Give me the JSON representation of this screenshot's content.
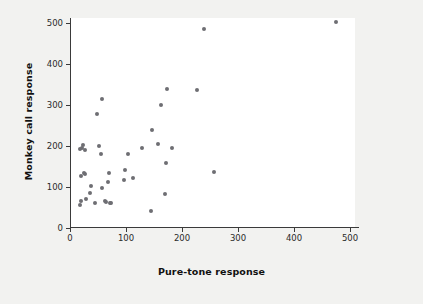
{
  "chart_data": {
    "type": "scatter",
    "title": "",
    "xlabel": "Pure-tone response",
    "ylabel": "Monkey call response",
    "xlim": [
      0,
      550
    ],
    "ylim": [
      0,
      520
    ],
    "xticks": [
      0,
      100,
      200,
      300,
      400,
      500
    ],
    "yticks": [
      0,
      100,
      200,
      300,
      400,
      500
    ],
    "grid": false,
    "legend": null,
    "marker_color": "#6e6e73",
    "background_color": "#f2f2f0",
    "plot_background_color": "#ffffff",
    "axis_color": "#3a3a3a",
    "points": [
      {
        "x": 17,
        "y": 193
      },
      {
        "x": 22,
        "y": 196
      },
      {
        "x": 24,
        "y": 203
      },
      {
        "x": 26,
        "y": 191
      },
      {
        "x": 17,
        "y": 57
      },
      {
        "x": 19,
        "y": 67
      },
      {
        "x": 20,
        "y": 128
      },
      {
        "x": 25,
        "y": 134
      },
      {
        "x": 27,
        "y": 131
      },
      {
        "x": 28,
        "y": 71
      },
      {
        "x": 36,
        "y": 85
      },
      {
        "x": 38,
        "y": 102
      },
      {
        "x": 44,
        "y": 62
      },
      {
        "x": 49,
        "y": 279
      },
      {
        "x": 52,
        "y": 200
      },
      {
        "x": 55,
        "y": 180
      },
      {
        "x": 57,
        "y": 315
      },
      {
        "x": 57,
        "y": 97
      },
      {
        "x": 62,
        "y": 67
      },
      {
        "x": 64,
        "y": 64
      },
      {
        "x": 68,
        "y": 111
      },
      {
        "x": 70,
        "y": 133
      },
      {
        "x": 71,
        "y": 62
      },
      {
        "x": 73,
        "y": 61
      },
      {
        "x": 96,
        "y": 117
      },
      {
        "x": 99,
        "y": 141
      },
      {
        "x": 103,
        "y": 181
      },
      {
        "x": 112,
        "y": 123
      },
      {
        "x": 129,
        "y": 194
      },
      {
        "x": 144,
        "y": 41
      },
      {
        "x": 146,
        "y": 239
      },
      {
        "x": 158,
        "y": 206
      },
      {
        "x": 163,
        "y": 301
      },
      {
        "x": 170,
        "y": 84
      },
      {
        "x": 172,
        "y": 158
      },
      {
        "x": 174,
        "y": 339
      },
      {
        "x": 182,
        "y": 194
      },
      {
        "x": 226,
        "y": 336
      },
      {
        "x": 240,
        "y": 485
      },
      {
        "x": 257,
        "y": 137
      },
      {
        "x": 475,
        "y": 502
      }
    ]
  }
}
